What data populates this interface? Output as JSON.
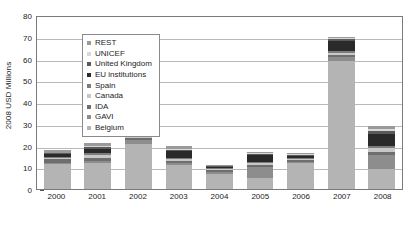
{
  "chart_data": {
    "type": "bar",
    "stacked": true,
    "title": "",
    "xlabel": "",
    "ylabel": "2008 USD Millions",
    "categories": [
      "2000",
      "2001",
      "2002",
      "2003",
      "2004",
      "2005",
      "2006",
      "2007",
      "2008"
    ],
    "ylim": [
      0,
      80
    ],
    "yticks": [
      0,
      10,
      20,
      30,
      40,
      50,
      60,
      70,
      80
    ],
    "grid": true,
    "legend_position": "upper-left-inside",
    "series": [
      {
        "name": "Belgium",
        "color": "#b4b4b4",
        "values": [
          11.5,
          12.0,
          20.5,
          11.0,
          7.0,
          5.0,
          12.0,
          59.0,
          9.0
        ]
      },
      {
        "name": "GAVI",
        "color": "#8d8d8d",
        "values": [
          0.6,
          1.0,
          2.0,
          0.8,
          1.0,
          5.0,
          0.6,
          1.5,
          6.5
        ]
      },
      {
        "name": "IDA",
        "color": "#6e6e6e",
        "values": [
          1.6,
          1.2,
          1.0,
          1.0,
          0.8,
          1.2,
          0.8,
          1.0,
          1.5
        ]
      },
      {
        "name": "Canada",
        "color": "#c8c8c8",
        "values": [
          0.5,
          1.6,
          1.2,
          1.0,
          0.6,
          0.8,
          0.6,
          1.2,
          2.0
        ]
      },
      {
        "name": "Spain",
        "color": "#7c7c7c",
        "values": [
          0.4,
          0.7,
          0.6,
          0.6,
          0.4,
          0.6,
          0.4,
          0.8,
          1.0
        ]
      },
      {
        "name": "EU institutions",
        "color": "#2a2a2a",
        "values": [
          1.4,
          2.0,
          0.8,
          3.0,
          0.5,
          3.0,
          0.8,
          4.5,
          5.5
        ]
      },
      {
        "name": "United Kingdom",
        "color": "#5a5a5a",
        "values": [
          0.5,
          0.8,
          0.6,
          0.6,
          0.3,
          0.5,
          0.4,
          0.8,
          1.2
        ]
      },
      {
        "name": "UNICEF",
        "color": "#d8d8d8",
        "values": [
          0.3,
          0.5,
          0.4,
          0.4,
          0.2,
          0.4,
          0.3,
          0.6,
          1.0
        ]
      },
      {
        "name": "REST",
        "color": "#9a9a9a",
        "values": [
          1.2,
          1.2,
          0.9,
          1.6,
          0.2,
          0.5,
          0.6,
          0.6,
          1.3
        ]
      }
    ],
    "totals": [
      19.0,
      21.0,
      28.0,
      20.0,
      11.0,
      17.0,
      16.5,
      70.0,
      29.0
    ]
  },
  "legend": {
    "items": [
      {
        "label": "REST",
        "color": "#9a9a9a"
      },
      {
        "label": "UNICEF",
        "color": "#d8d8d8"
      },
      {
        "label": "United Kingdom",
        "color": "#5a5a5a"
      },
      {
        "label": "EU institutions",
        "color": "#2a2a2a"
      },
      {
        "label": "Spain",
        "color": "#7c7c7c"
      },
      {
        "label": "Canada",
        "color": "#c8c8c8"
      },
      {
        "label": "IDA",
        "color": "#6e6e6e"
      },
      {
        "label": "GAVI",
        "color": "#8d8d8d"
      },
      {
        "label": "Belgium",
        "color": "#b4b4b4"
      }
    ]
  },
  "colors": {
    "axis": "#7a7a7a",
    "grid": "#b9b9b9",
    "text": "#222222",
    "background": "#ffffff"
  }
}
